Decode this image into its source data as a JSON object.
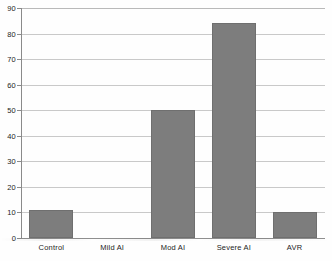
{
  "chart_data": {
    "type": "bar",
    "title": "",
    "subtitle": "",
    "xlabel": "",
    "ylabel": "",
    "categories": [
      "Control",
      "Mild AI",
      "Mod AI",
      "Severe AI",
      "AVR"
    ],
    "values": [
      11,
      0,
      50,
      84,
      10
    ],
    "ylim": [
      0,
      90
    ],
    "ytick_labels": [
      "0",
      "10",
      "20",
      "30",
      "40",
      "50",
      "60",
      "70",
      "80",
      "90"
    ],
    "ytick_values": [
      0,
      10,
      20,
      30,
      40,
      50,
      60,
      70,
      80,
      90
    ],
    "grid": true,
    "grid_axis": "y",
    "legend": false,
    "legend_position": "none",
    "annotations": [],
    "bar_color": "#7d7d7d",
    "bar_edge_color": "#6f6f6f",
    "grid_color": "#c9c9c9",
    "axis_color": "#8a8a8a",
    "background_color": "#fefefe",
    "text_color": "#1d1d1d"
  }
}
